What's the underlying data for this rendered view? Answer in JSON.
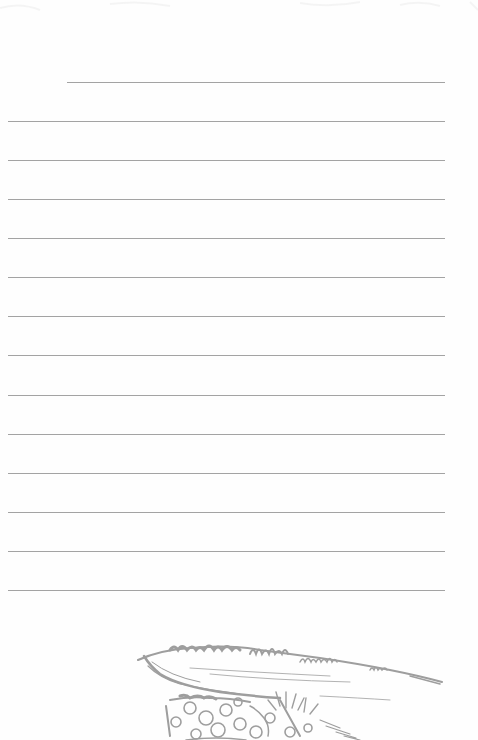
{
  "page": {
    "type": "lined-stationery",
    "background_color": "#fefefe",
    "rule_color": "#a3a3a3"
  },
  "rules": [
    {
      "y": 82,
      "x1": 67,
      "x2": 445
    },
    {
      "y": 121,
      "x1": 8,
      "x2": 445
    },
    {
      "y": 160,
      "x1": 8,
      "x2": 445
    },
    {
      "y": 199,
      "x1": 8,
      "x2": 445
    },
    {
      "y": 238,
      "x1": 8,
      "x2": 445
    },
    {
      "y": 277,
      "x1": 8,
      "x2": 445
    },
    {
      "y": 316,
      "x1": 8,
      "x2": 445
    },
    {
      "y": 355,
      "x1": 8,
      "x2": 445
    },
    {
      "y": 395,
      "x1": 8,
      "x2": 445
    },
    {
      "y": 434,
      "x1": 8,
      "x2": 445
    },
    {
      "y": 473,
      "x1": 8,
      "x2": 445
    },
    {
      "y": 512,
      "x1": 8,
      "x2": 445
    },
    {
      "y": 551,
      "x1": 8,
      "x2": 445
    },
    {
      "y": 590,
      "x1": 8,
      "x2": 445
    }
  ],
  "illustration": {
    "subject": "landscape-sketch-path-river-flowers",
    "color": "#9e9e9e"
  }
}
